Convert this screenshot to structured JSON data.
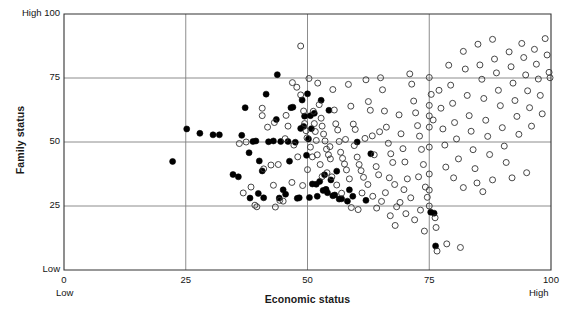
{
  "chart_data": {
    "type": "scatter",
    "title": "",
    "xlabel": "Economic status",
    "ylabel": "Family status",
    "xlim": [
      0,
      100
    ],
    "ylim": [
      0,
      100
    ],
    "xticks": [
      0,
      25,
      50,
      75,
      100
    ],
    "yticks": [
      0,
      25,
      50,
      75,
      100
    ],
    "xtick_labels": [
      "0",
      "25",
      "50",
      "75",
      "100"
    ],
    "ytick_labels": [
      "Low",
      "25",
      "50",
      "75",
      "High 100"
    ],
    "grid": true,
    "grid_color": "#808080",
    "axis_color": "#333333",
    "x_axis_low_label": "Low",
    "x_axis_high_label": "High",
    "y_axis_low_label": "Low",
    "y_axis_high_label": "High",
    "legend": [],
    "series": [
      {
        "name": "filled",
        "marker": "filled-circle",
        "color": "#000000",
        "fill": "#000000",
        "radius": 3.0,
        "points": [
          [
            22.3,
            42.4
          ],
          [
            25.2,
            55.1
          ],
          [
            27.9,
            53.4
          ],
          [
            30.6,
            52.8
          ],
          [
            31.9,
            52.8
          ],
          [
            34.7,
            37.3
          ],
          [
            35.8,
            36.4
          ],
          [
            36.5,
            52.6
          ],
          [
            37.2,
            63.4
          ],
          [
            38.0,
            45.8
          ],
          [
            38.2,
            28.1
          ],
          [
            38.8,
            50.2
          ],
          [
            39.4,
            50.4
          ],
          [
            39.9,
            29.9
          ],
          [
            40.1,
            42.6
          ],
          [
            40.7,
            38.7
          ],
          [
            41.0,
            28.2
          ],
          [
            41.5,
            68.7
          ],
          [
            42.0,
            50.1
          ],
          [
            43.0,
            50.4
          ],
          [
            43.6,
            58.8
          ],
          [
            43.8,
            76.3
          ],
          [
            44.2,
            28.1
          ],
          [
            44.5,
            50.2
          ],
          [
            45.0,
            31.3
          ],
          [
            45.5,
            29.6
          ],
          [
            46.0,
            50.2
          ],
          [
            46.3,
            42.5
          ],
          [
            46.6,
            63.4
          ],
          [
            47.0,
            63.6
          ],
          [
            47.5,
            49.9
          ],
          [
            47.9,
            28.0
          ],
          [
            48.3,
            28.2
          ],
          [
            48.6,
            55.3
          ],
          [
            48.9,
            66.4
          ],
          [
            49.2,
            56.1
          ],
          [
            49.4,
            60.1
          ],
          [
            49.8,
            44.8
          ],
          [
            50.0,
            68.8
          ],
          [
            50.2,
            51.2
          ],
          [
            50.4,
            28.3
          ],
          [
            50.6,
            60.3
          ],
          [
            50.8,
            55.2
          ],
          [
            51.0,
            33.6
          ],
          [
            51.4,
            61.2
          ],
          [
            51.8,
            33.5
          ],
          [
            52.0,
            28.8
          ],
          [
            52.5,
            34.6
          ],
          [
            52.8,
            66.3
          ],
          [
            53.2,
            31.1
          ],
          [
            53.5,
            37.2
          ],
          [
            53.8,
            31.5
          ],
          [
            54.1,
            30.2
          ],
          [
            54.4,
            62.4
          ],
          [
            54.8,
            35.2
          ],
          [
            55.2,
            29.0
          ],
          [
            55.6,
            29.3
          ],
          [
            56.0,
            38.6
          ],
          [
            56.5,
            27.7
          ],
          [
            57.0,
            27.8
          ],
          [
            58.2,
            26.9
          ],
          [
            58.6,
            31.3
          ],
          [
            59.3,
            28.8
          ],
          [
            60.2,
            50.0
          ],
          [
            62.0,
            27.2
          ],
          [
            63.0,
            45.4
          ],
          [
            75.3,
            22.6
          ],
          [
            76.0,
            22.2
          ],
          [
            76.3,
            9.4
          ]
        ]
      },
      {
        "name": "open",
        "marker": "open-circle",
        "color": "#333333",
        "fill": "none",
        "radius": 3.0,
        "points": [
          [
            40.7,
            63.2
          ],
          [
            40.7,
            60.3
          ],
          [
            43.0,
            33.1
          ],
          [
            44.3,
            27.2
          ],
          [
            45.0,
            26.9
          ],
          [
            45.4,
            51.3
          ],
          [
            41.0,
            39.5
          ],
          [
            39.2,
            25.3
          ],
          [
            39.6,
            24.7
          ],
          [
            48.6,
            87.5
          ],
          [
            46.9,
            73.2
          ],
          [
            47.8,
            71.4
          ],
          [
            48.6,
            68.4
          ],
          [
            49.2,
            62.1
          ],
          [
            49.4,
            57.2
          ],
          [
            49.7,
            54.4
          ],
          [
            49.9,
            51.6
          ],
          [
            50.3,
            74.8
          ],
          [
            51.2,
            62.0
          ],
          [
            51.4,
            57.2
          ],
          [
            51.6,
            54.1
          ],
          [
            52.1,
            73.0
          ],
          [
            52.4,
            64.6
          ],
          [
            52.8,
            59.3
          ],
          [
            53.0,
            56.2
          ],
          [
            53.3,
            53.1
          ],
          [
            53.6,
            50.4
          ],
          [
            53.9,
            47.2
          ],
          [
            54.3,
            45.0
          ],
          [
            54.7,
            43.4
          ],
          [
            55.2,
            70.5
          ],
          [
            55.5,
            62.5
          ],
          [
            55.8,
            57.1
          ],
          [
            56.2,
            54.7
          ],
          [
            56.5,
            50.2
          ],
          [
            56.8,
            46.0
          ],
          [
            57.2,
            43.6
          ],
          [
            57.6,
            41.4
          ],
          [
            58.0,
            39.1
          ],
          [
            58.4,
            72.5
          ],
          [
            58.9,
            64.0
          ],
          [
            59.4,
            57.0
          ],
          [
            59.8,
            54.9
          ],
          [
            60.2,
            44.1
          ],
          [
            60.6,
            41.2
          ],
          [
            61.0,
            38.8
          ],
          [
            61.5,
            36.2
          ],
          [
            62.0,
            74.3
          ],
          [
            62.5,
            65.8
          ],
          [
            62.9,
            62.4
          ],
          [
            63.3,
            52.4
          ],
          [
            63.7,
            45.0
          ],
          [
            64.1,
            40.4
          ],
          [
            64.6,
            37.2
          ],
          [
            65.0,
            75.1
          ],
          [
            65.4,
            70.4
          ],
          [
            65.8,
            62.1
          ],
          [
            66.2,
            55.8
          ],
          [
            66.6,
            49.5
          ],
          [
            67.1,
            45.4
          ],
          [
            67.5,
            42.0
          ],
          [
            67.9,
            33.4
          ],
          [
            68.3,
            24.7
          ],
          [
            68.8,
            60.6
          ],
          [
            69.2,
            53.2
          ],
          [
            69.6,
            47.4
          ],
          [
            70.0,
            42.2
          ],
          [
            70.5,
            35.6
          ],
          [
            71.0,
            76.6
          ],
          [
            71.4,
            72.6
          ],
          [
            71.8,
            66.0
          ],
          [
            72.2,
            61.4
          ],
          [
            72.6,
            56.4
          ],
          [
            73.0,
            52.3
          ],
          [
            73.4,
            47.1
          ],
          [
            73.8,
            41.2
          ],
          [
            74.2,
            32.4
          ],
          [
            74.6,
            28.4
          ],
          [
            75.0,
            75.2
          ],
          [
            75.0,
            64.3
          ],
          [
            75.0,
            60.2
          ],
          [
            75.0,
            55.8
          ],
          [
            75.0,
            48.0
          ],
          [
            75.0,
            37.5
          ],
          [
            75.0,
            31.2
          ],
          [
            75.0,
            25.0
          ],
          [
            75.4,
            68.6
          ],
          [
            75.8,
            58.6
          ],
          [
            76.2,
            20.4
          ],
          [
            76.4,
            16.6
          ],
          [
            76.6,
            7.4
          ],
          [
            77.0,
            70.2
          ],
          [
            77.4,
            63.2
          ],
          [
            77.8,
            55.1
          ],
          [
            78.2,
            48.8
          ],
          [
            78.6,
            10.2
          ],
          [
            79.0,
            80.0
          ],
          [
            79.4,
            72.2
          ],
          [
            79.8,
            65.1
          ],
          [
            80.2,
            57.6
          ],
          [
            80.6,
            51.2
          ],
          [
            81.0,
            43.4
          ],
          [
            81.4,
            8.8
          ],
          [
            82.0,
            85.4
          ],
          [
            82.4,
            78.5
          ],
          [
            82.8,
            68.2
          ],
          [
            83.2,
            60.3
          ],
          [
            83.6,
            54.2
          ],
          [
            84.0,
            47.0
          ],
          [
            84.4,
            39.6
          ],
          [
            85.0,
            88.2
          ],
          [
            85.4,
            80.1
          ],
          [
            85.8,
            74.5
          ],
          [
            86.2,
            67.0
          ],
          [
            86.6,
            58.5
          ],
          [
            87.0,
            52.2
          ],
          [
            87.4,
            45.1
          ],
          [
            88.0,
            90.1
          ],
          [
            88.4,
            82.4
          ],
          [
            88.8,
            77.0
          ],
          [
            89.2,
            70.2
          ],
          [
            89.6,
            64.2
          ],
          [
            90.0,
            55.6
          ],
          [
            90.4,
            48.4
          ],
          [
            90.8,
            42.0
          ],
          [
            91.4,
            85.2
          ],
          [
            91.8,
            79.4
          ],
          [
            92.2,
            73.0
          ],
          [
            92.6,
            66.2
          ],
          [
            93.0,
            60.0
          ],
          [
            93.4,
            53.0
          ],
          [
            94.0,
            88.5
          ],
          [
            94.4,
            83.0
          ],
          [
            94.8,
            76.2
          ],
          [
            95.2,
            70.0
          ],
          [
            95.6,
            63.4
          ],
          [
            96.0,
            56.2
          ],
          [
            96.6,
            86.2
          ],
          [
            97.0,
            80.4
          ],
          [
            97.4,
            74.6
          ],
          [
            97.8,
            68.2
          ],
          [
            98.2,
            61.0
          ],
          [
            98.8,
            90.4
          ],
          [
            99.2,
            84.0
          ],
          [
            99.6,
            77.2
          ],
          [
            99.8,
            75.1
          ],
          [
            44.0,
            41.2
          ],
          [
            42.5,
            41.0
          ],
          [
            37.4,
            50.0
          ],
          [
            36.0,
            49.4
          ],
          [
            51.0,
            44.2
          ],
          [
            52.0,
            45.0
          ],
          [
            54.0,
            38.0
          ],
          [
            56.0,
            33.2
          ],
          [
            57.0,
            30.0
          ],
          [
            58.6,
            35.6
          ],
          [
            59.0,
            24.4
          ],
          [
            60.4,
            23.6
          ],
          [
            61.2,
            30.1
          ],
          [
            62.4,
            33.4
          ],
          [
            63.4,
            28.8
          ],
          [
            64.2,
            24.2
          ],
          [
            65.2,
            26.8
          ],
          [
            66.0,
            30.2
          ],
          [
            67.0,
            21.2
          ],
          [
            68.0,
            17.4
          ],
          [
            69.0,
            26.4
          ],
          [
            70.2,
            22.0
          ],
          [
            71.2,
            28.2
          ],
          [
            72.0,
            19.6
          ],
          [
            73.2,
            23.4
          ],
          [
            74.0,
            15.2
          ],
          [
            41.8,
            55.8
          ],
          [
            43.2,
            57.6
          ],
          [
            45.6,
            60.4
          ],
          [
            46.0,
            56.2
          ],
          [
            47.2,
            48.8
          ],
          [
            48.0,
            44.2
          ],
          [
            50.6,
            48.0
          ],
          [
            51.8,
            50.6
          ],
          [
            52.6,
            41.2
          ],
          [
            53.0,
            36.5
          ],
          [
            55.0,
            36.4
          ],
          [
            59.6,
            48.6
          ],
          [
            64.8,
            54.0
          ],
          [
            66.8,
            36.0
          ],
          [
            78.4,
            40.2
          ],
          [
            80.0,
            36.0
          ],
          [
            82.0,
            32.2
          ],
          [
            84.8,
            34.0
          ],
          [
            86.0,
            30.6
          ],
          [
            88.0,
            35.2
          ],
          [
            92.0,
            36.0
          ],
          [
            95.0,
            38.0
          ],
          [
            36.8,
            30.1
          ],
          [
            38.4,
            32.4
          ],
          [
            43.4,
            24.6
          ],
          [
            46.8,
            34.2
          ],
          [
            49.0,
            33.0
          ],
          [
            50.0,
            39.2
          ],
          [
            54.6,
            48.2
          ],
          [
            57.8,
            51.0
          ],
          [
            61.8,
            51.4
          ],
          [
            69.8,
            31.4
          ],
          [
            72.8,
            36.4
          ]
        ]
      }
    ]
  }
}
